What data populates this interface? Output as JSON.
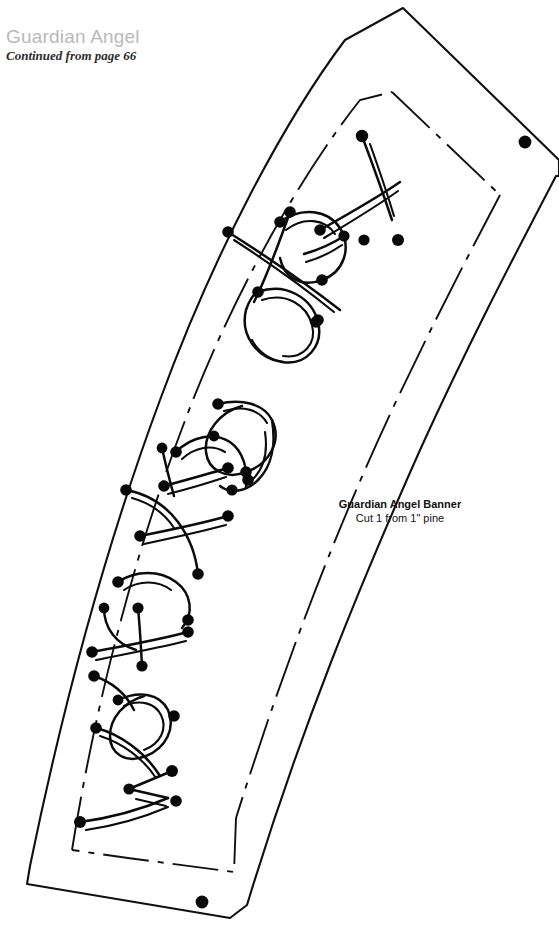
{
  "page": {
    "width": 559,
    "height": 936,
    "background": "#ffffff",
    "ink_color": "#101010"
  },
  "header": {
    "project_title": "Guardian Angel",
    "project_title_color": "#b9b9b9",
    "continuation_note": "Continued from page 66"
  },
  "part_label": {
    "name": "Guardian Angel Banner",
    "instruction": "Cut 1 from 1\" pine"
  },
  "pattern": {
    "kind": "scroll-saw-template",
    "lettering_text": "Watching over",
    "lettering_style": "double-line stencil strokes with round drill-start points",
    "inner_border_style": "dashed",
    "drill_point_count": 2,
    "drill_point_radius": 6,
    "outer_outline_description": "long curved banner tapering from a pointed apex at upper right down to a flat base at lower left",
    "stroke_color": "#0b0b0b"
  }
}
